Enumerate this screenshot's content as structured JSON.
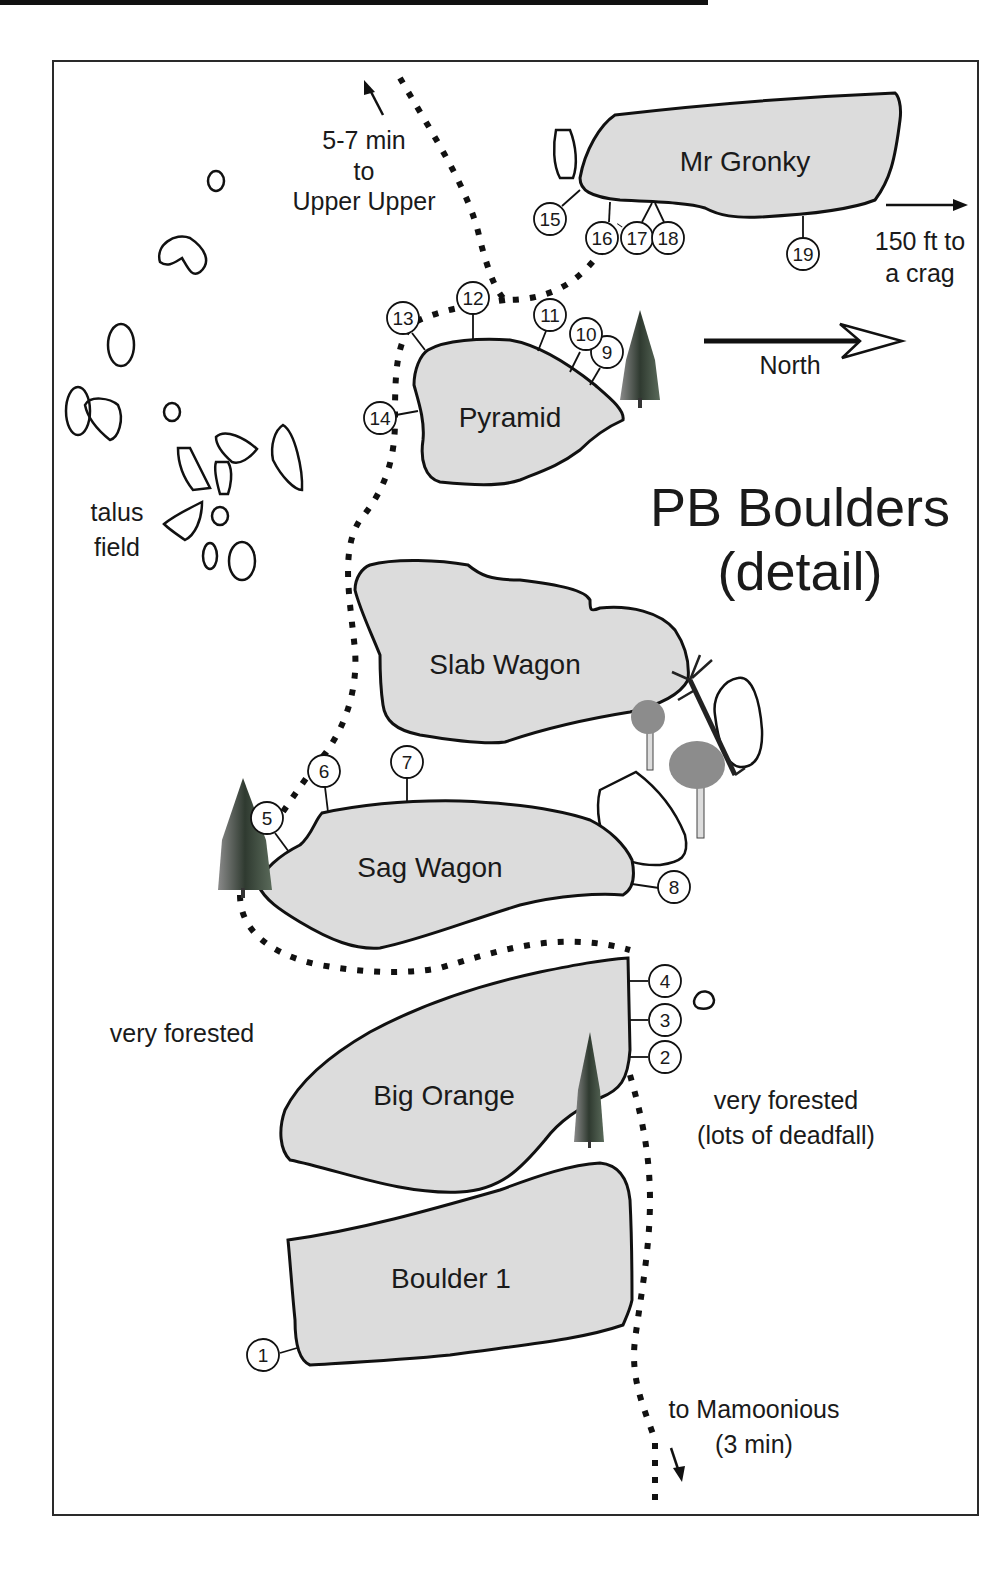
{
  "map": {
    "title_line1": "PB Boulders",
    "title_line2": "(detail)",
    "north_label": "North",
    "colors": {
      "boulder_fill": "#dcdcdc",
      "outline": "#111111",
      "background": "#ffffff",
      "tree_conifer": "#3a4a3a",
      "tree_deciduous": "#8c8c8c"
    },
    "notes": {
      "upper_line1": "5-7 min",
      "upper_line2": "to",
      "upper_line3": "Upper Upper",
      "crag_line1": "150 ft to",
      "crag_line2": "a crag",
      "talus_line1": "talus",
      "talus_line2": "field",
      "forest_left": "very forested",
      "forest_right_line1": "very forested",
      "forest_right_line2": "(lots of deadfall)",
      "mamoonious_line1": "to Mamoonious",
      "mamoonious_line2": "(3 min)"
    },
    "boulders": [
      {
        "name": "Mr Gronky",
        "problems": [
          "15",
          "16",
          "17",
          "18",
          "19"
        ]
      },
      {
        "name": "Pyramid",
        "problems": [
          "9",
          "10",
          "11",
          "12",
          "13",
          "14"
        ]
      },
      {
        "name": "Slab Wagon",
        "problems": []
      },
      {
        "name": "Sag Wagon",
        "problems": [
          "5",
          "6",
          "7",
          "8"
        ]
      },
      {
        "name": "Big Orange",
        "problems": [
          "2",
          "3",
          "4"
        ]
      },
      {
        "name": "Boulder 1",
        "problems": [
          "1"
        ]
      }
    ],
    "problem_numbers": [
      "1",
      "2",
      "3",
      "4",
      "5",
      "6",
      "7",
      "8",
      "9",
      "10",
      "11",
      "12",
      "13",
      "14",
      "15",
      "16",
      "17",
      "18",
      "19"
    ]
  }
}
